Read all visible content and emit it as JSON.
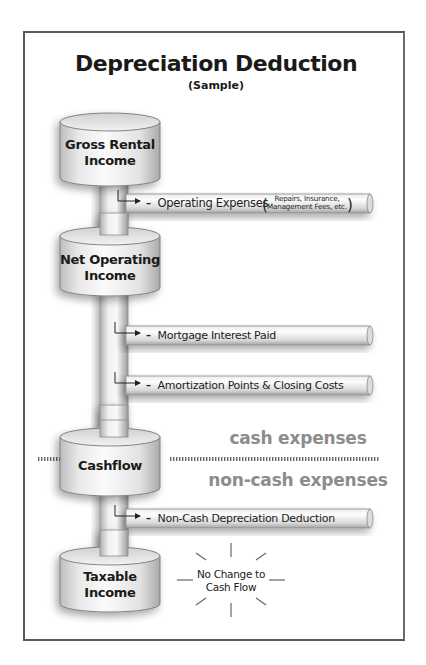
{
  "title": "Depreciation Deduction",
  "subtitle": "(Sample)",
  "stages": [
    {
      "id": "gross-rental-income",
      "line1": "Gross Rental",
      "line2": "Income"
    },
    {
      "id": "net-operating-income",
      "line1": "Net Operating",
      "line2": "Income"
    },
    {
      "id": "cashflow",
      "line1": "Cashflow",
      "line2": ""
    },
    {
      "id": "taxable-income",
      "line1": "Taxable",
      "line2": "Income"
    }
  ],
  "deductions": [
    {
      "id": "operating-expenses",
      "minus": "–",
      "label": "Operating Expenses",
      "note_line1": "Repairs, Insurance,",
      "note_line2": "Management Fees, etc."
    },
    {
      "id": "mortgage-interest",
      "minus": "–",
      "label": "Mortgage Interest Paid"
    },
    {
      "id": "amortization",
      "minus": "–",
      "label": "Amortization Points & Closing Costs"
    },
    {
      "id": "depreciation",
      "minus": "–",
      "label": "Non-Cash Depreciation Deduction"
    }
  ],
  "zones": {
    "cash": "cash expenses",
    "non_cash": "non-cash expenses"
  },
  "callout": {
    "line1": "No Change to",
    "line2": "Cash Flow"
  },
  "colors": {
    "frame": "#5a5a5a",
    "zone_text": "#8c8c8c",
    "text": "#1a1a1a",
    "cylinder_light": "#f4f4f4",
    "cylinder_dark": "#b5b5b5"
  }
}
